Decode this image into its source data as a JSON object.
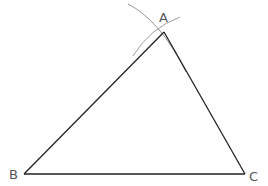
{
  "diagram": {
    "vertices": [
      {
        "label": "A",
        "x": 164,
        "y": 32
      },
      {
        "label": "B",
        "x": 24,
        "y": 174
      },
      {
        "label": "C",
        "x": 245,
        "y": 174
      }
    ],
    "labels": {
      "A": "A",
      "B": "B",
      "C": "C"
    },
    "colors": {
      "edge": "#222222",
      "arc": "#999999",
      "label": "#555555"
    }
  }
}
